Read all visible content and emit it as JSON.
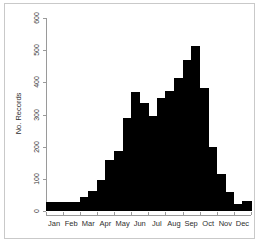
{
  "chart_data": {
    "type": "bar",
    "title": "",
    "xlabel": "",
    "ylabel": "No. Records",
    "ylim": [
      0,
      600
    ],
    "yticks": [
      0,
      100,
      200,
      300,
      400,
      500,
      600
    ],
    "ytick_labels": [
      "0",
      "100",
      "200",
      "300",
      "400",
      "500",
      "600"
    ],
    "grid": false,
    "legend": false,
    "bar_color": "#000000",
    "axis_color": "#9a9a9a",
    "categories": [
      "Jan",
      "Feb",
      "Mar",
      "Apr",
      "May",
      "Jun",
      "Jul",
      "Aug",
      "Sep",
      "Oct",
      "Nov",
      "Dec"
    ],
    "bins": [
      {
        "label": "Jan a",
        "value": 28
      },
      {
        "label": "Jan b",
        "value": 28
      },
      {
        "label": "Feb a",
        "value": 28
      },
      {
        "label": "Feb b",
        "value": 28
      },
      {
        "label": "Mar a",
        "value": 45
      },
      {
        "label": "Mar b",
        "value": 62
      },
      {
        "label": "Apr a",
        "value": 95
      },
      {
        "label": "Apr b",
        "value": 160
      },
      {
        "label": "May a",
        "value": 185
      },
      {
        "label": "May b",
        "value": 290
      },
      {
        "label": "Jun a",
        "value": 370
      },
      {
        "label": "Jun b",
        "value": 337
      },
      {
        "label": "Jul a",
        "value": 296
      },
      {
        "label": "Jul b",
        "value": 350
      },
      {
        "label": "Aug a",
        "value": 373
      },
      {
        "label": "Aug b",
        "value": 413
      },
      {
        "label": "Sep a",
        "value": 470
      },
      {
        "label": "Sep b",
        "value": 512
      },
      {
        "label": "Oct a",
        "value": 382
      },
      {
        "label": "Oct b",
        "value": 200
      },
      {
        "label": "Nov a",
        "value": 115
      },
      {
        "label": "Nov b",
        "value": 60
      },
      {
        "label": "Dec a",
        "value": 22
      },
      {
        "label": "Dec b",
        "value": 32
      }
    ]
  }
}
